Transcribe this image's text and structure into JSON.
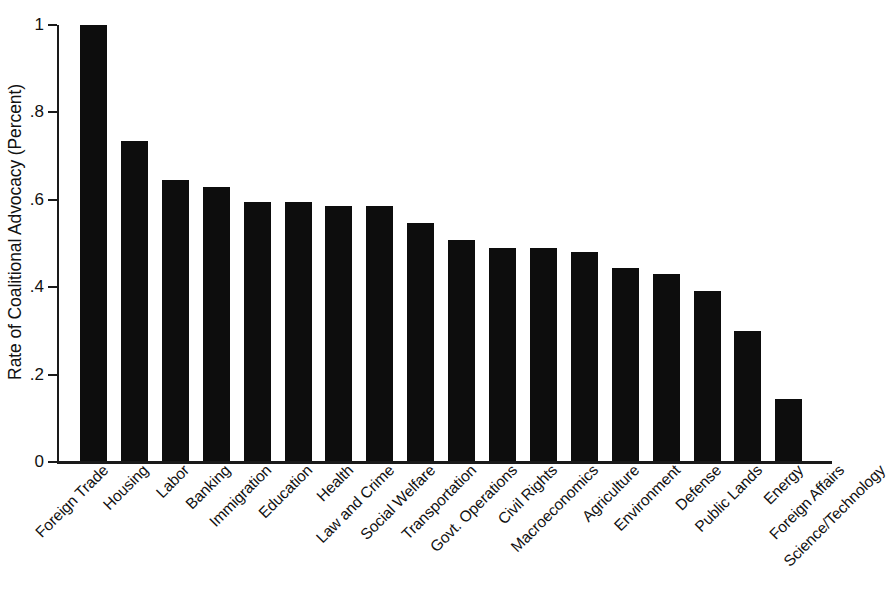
{
  "chart_data": {
    "type": "bar",
    "title": "",
    "subtitle": "",
    "xlabel": "",
    "ylabel": "Rate of Coalitional Advocacy (Percent)",
    "ylim": [
      0,
      1
    ],
    "yticks": [
      "0",
      ".2",
      ".4",
      ".6",
      ".8",
      "1"
    ],
    "ytick_values": [
      0,
      0.2,
      0.4,
      0.6,
      0.8,
      1
    ],
    "grid": false,
    "legend": false,
    "legend_position": "none",
    "bar_color": "#0d0d0d",
    "axis_color": "#1a1a1a",
    "background_color": "#ffffff",
    "categories": [
      "Foreign Trade",
      "Housing",
      "Labor",
      "Banking",
      "Immigration",
      "Education",
      "Health",
      "Law and Crime",
      "Social Welfare",
      "Transportation",
      "Govt. Operations",
      "Civil Rights",
      "Macroeconomics",
      "Agriculture",
      "Environment",
      "Defense",
      "Public Lands",
      "Energy",
      "Foreign Affairs",
      "Science/Technology"
    ],
    "values": [
      1.0,
      0.735,
      0.645,
      0.63,
      0.595,
      0.595,
      0.585,
      0.585,
      0.548,
      0.507,
      0.49,
      0.49,
      0.48,
      0.445,
      0.43,
      0.392,
      0.3,
      0.145,
      0.0,
      0.0
    ]
  }
}
